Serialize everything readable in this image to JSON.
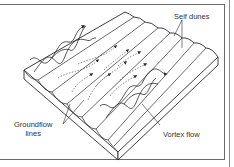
{
  "diagram": {
    "labels": {
      "seif_dunes": "Seif dunes",
      "groundflow_line1": "Groundflow",
      "groundflow_line2": "lines",
      "vortex_flow": "Vortex flow"
    },
    "colors": {
      "line": "#2a2a2a",
      "dashed": "#555555",
      "frame": "#6a6a6a",
      "face": "#ffffff"
    }
  }
}
